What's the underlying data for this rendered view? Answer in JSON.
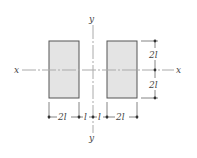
{
  "diagram": {
    "axes": {
      "x_left_label": "x",
      "x_right_label": "x",
      "y_top_label": "y",
      "y_bottom_label": "y"
    },
    "shapes": [
      {
        "name": "left-rectangle",
        "width": "2l",
        "height": "4l"
      },
      {
        "name": "right-rectangle",
        "width": "2l",
        "height": "4l"
      }
    ],
    "dimensions": {
      "horizontal": [
        "2l",
        "l",
        "l",
        "2l"
      ],
      "vertical": [
        "2l",
        "2l"
      ]
    },
    "colors": {
      "fill": "#e4e4e4",
      "stroke": "#555555",
      "axis": "#aaaaaa",
      "text": "#444444"
    }
  }
}
